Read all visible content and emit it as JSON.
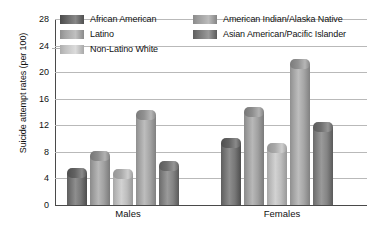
{
  "chart_data": {
    "type": "bar",
    "title": "",
    "xlabel": "",
    "ylabel": "Suicide attempt rates (per 100)",
    "categories": [
      "Males",
      "Females"
    ],
    "ylim": [
      0,
      28
    ],
    "yticks": [
      0,
      4,
      8,
      12,
      16,
      20,
      24,
      28
    ],
    "ytick_labels": [
      "0",
      "4",
      "8",
      "12",
      "16",
      "20",
      "24",
      "28"
    ],
    "grid": true,
    "legend_position": "top",
    "series": [
      {
        "name": "African American",
        "values": [
          4.8,
          9.4
        ]
      },
      {
        "name": "Latino",
        "values": [
          7.4,
          14.0
        ]
      },
      {
        "name": "Non-Latino White",
        "values": [
          4.7,
          8.6
        ]
      },
      {
        "name": "American Indian/Alaska Native",
        "values": [
          13.6,
          21.3
        ]
      },
      {
        "name": "Asian American/Pacific Islander",
        "values": [
          5.8,
          11.8
        ]
      }
    ]
  },
  "legend": {
    "items": [
      {
        "label": "African American",
        "swatch": "legend-swatch-african-american"
      },
      {
        "label": "Latino",
        "swatch": "legend-swatch-latino"
      },
      {
        "label": "Non-Latino White",
        "swatch": "legend-swatch-non-latino-white"
      },
      {
        "label": "American Indian/Alaska Native",
        "swatch": "legend-swatch-american-indian-alaska-native"
      },
      {
        "label": "Asian American/Pacific Islander",
        "swatch": "legend-swatch-asian-american-pacific-islander"
      }
    ]
  },
  "colors": {
    "gridline": "#b9b9b9",
    "axis": "#4a4a4a",
    "text": "#111111",
    "background": "#ffffff"
  }
}
